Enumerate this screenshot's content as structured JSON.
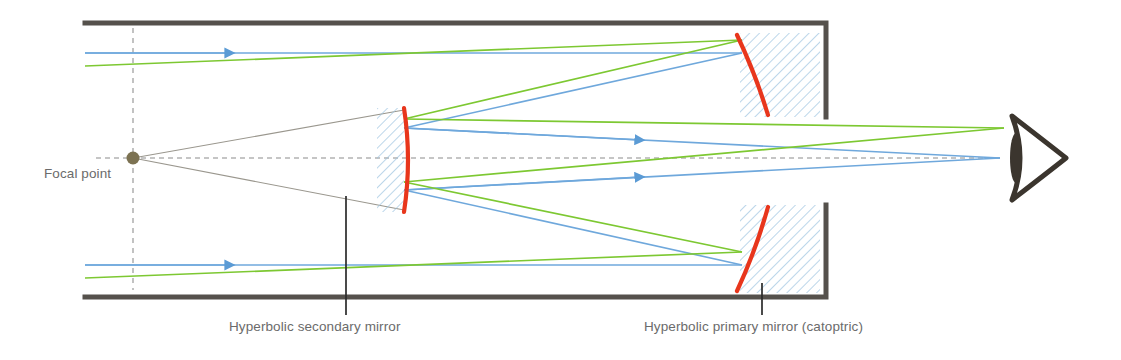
{
  "diagram": {
    "labels": {
      "focal_point": "Focal point",
      "secondary_mirror": "Hyperbolic secondary mirror",
      "primary_mirror": "Hyperbolic primary mirror (catoptric)"
    },
    "colors": {
      "ray_blue": "#6FA8DC",
      "ray_green": "#7DC832",
      "mirror_red": "#E8361C",
      "tube_dark": "#55514C",
      "hatch_blue": "#9CC3E0",
      "focal_dot": "#7C7252",
      "cone_gray": "#9A978E",
      "axis_gray": "#8C8C8C",
      "label_gray": "#6b6b6b",
      "eye_dark": "#3B352E"
    },
    "elements": {
      "tube_label": "telescope tube",
      "axis_label": "optical axis",
      "focal_axis_label": "focal plane marker",
      "eye_label": "observer eye",
      "primary_top_label": "primary mirror top segment",
      "primary_bottom_label": "primary mirror bottom segment",
      "secondary_label": "secondary mirror"
    },
    "geometry": {
      "tube_top_y": 23,
      "tube_bottom_y": 297,
      "tube_left_x": 85,
      "tube_right_x": 826,
      "aperture_top_y": 117,
      "aperture_bottom_y": 205,
      "axis_y": 158,
      "focal_point_x": 133,
      "focal_point_y": 158,
      "secondary_x": 377,
      "secondary_width": 27,
      "primary_x": 740,
      "primary_width": 80
    }
  }
}
